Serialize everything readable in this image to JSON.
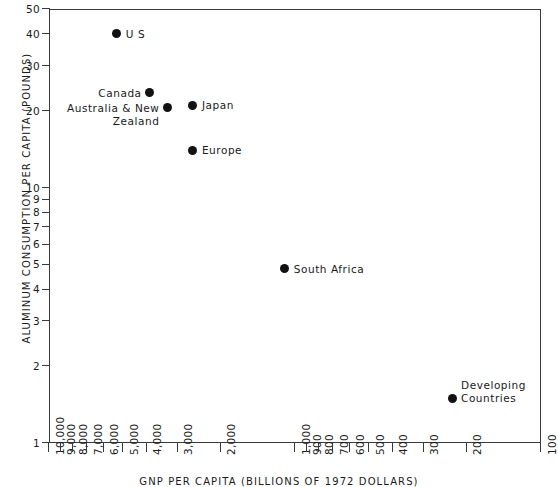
{
  "chart_data": {
    "type": "scatter",
    "title": "",
    "xlabel": "GNP PER CAPITA (BILLIONS OF 1972 DOLLARS)",
    "ylabel": "ALUMINUM CONSUMPTION PER CAPITA (POUNDS)",
    "xscale": "log",
    "yscale": "log",
    "x_reversed": true,
    "xlim": [
      10000,
      100
    ],
    "ylim": [
      1,
      50
    ],
    "grid": false,
    "legend": "none",
    "xticks": [
      {
        "value": 10000,
        "label": "10,000"
      },
      {
        "value": 9000,
        "label": "9,000"
      },
      {
        "value": 8000,
        "label": "8,000"
      },
      {
        "value": 7000,
        "label": "7,000"
      },
      {
        "value": 6000,
        "label": "6,000"
      },
      {
        "value": 5000,
        "label": "5,000"
      },
      {
        "value": 4000,
        "label": "4,000"
      },
      {
        "value": 3000,
        "label": "3,000"
      },
      {
        "value": 2000,
        "label": "2,000"
      },
      {
        "value": 1000,
        "label": "1,000"
      },
      {
        "value": 900,
        "label": "900"
      },
      {
        "value": 800,
        "label": "800"
      },
      {
        "value": 700,
        "label": "700"
      },
      {
        "value": 600,
        "label": "600"
      },
      {
        "value": 500,
        "label": "500"
      },
      {
        "value": 400,
        "label": "400"
      },
      {
        "value": 300,
        "label": "300"
      },
      {
        "value": 200,
        "label": "200"
      },
      {
        "value": 100,
        "label": "100"
      }
    ],
    "yticks": [
      {
        "value": 1,
        "label": "1"
      },
      {
        "value": 2,
        "label": "2"
      },
      {
        "value": 3,
        "label": "3"
      },
      {
        "value": 4,
        "label": "4"
      },
      {
        "value": 5,
        "label": "5"
      },
      {
        "value": 6,
        "label": "6"
      },
      {
        "value": 7,
        "label": "7"
      },
      {
        "value": 8,
        "label": "8"
      },
      {
        "value": 9,
        "label": "9"
      },
      {
        "value": 10,
        "label": "10"
      },
      {
        "value": 20,
        "label": "20"
      },
      {
        "value": 30,
        "label": "30"
      },
      {
        "value": 40,
        "label": "40"
      },
      {
        "value": 50,
        "label": "50"
      }
    ],
    "points": [
      {
        "name": "U S",
        "label": "U S",
        "x": 5300,
        "y": 40.0,
        "label_side": "right",
        "label_lines": [
          "U S"
        ]
      },
      {
        "name": "Canada",
        "label": "Canada",
        "x": 3900,
        "y": 23.5,
        "label_side": "left",
        "label_lines": [
          "Canada"
        ]
      },
      {
        "name": "Australia & New Zealand",
        "label": "Australia & New Zealand",
        "x": 3300,
        "y": 20.5,
        "label_side": "left",
        "label_lines": [
          "Australia & New",
          "Zealand"
        ]
      },
      {
        "name": "Japan",
        "label": "Japan",
        "x": 2600,
        "y": 21.0,
        "label_side": "right",
        "label_lines": [
          "Japan"
        ]
      },
      {
        "name": "Europe",
        "label": "Europe",
        "x": 2600,
        "y": 14.0,
        "label_side": "right",
        "label_lines": [
          "Europe"
        ]
      },
      {
        "name": "South Africa",
        "label": "South Africa",
        "x": 1100,
        "y": 4.8,
        "label_side": "right",
        "label_lines": [
          "South Africa"
        ]
      },
      {
        "name": "Developing Countries",
        "label": "Developing Countries",
        "x": 230,
        "y": 1.5,
        "label_side": "right",
        "label_lines": [
          "Developing",
          "Countries"
        ]
      }
    ]
  }
}
